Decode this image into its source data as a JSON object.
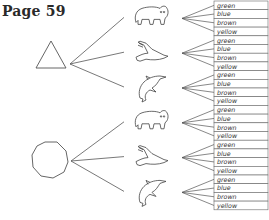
{
  "title": "Page 59",
  "diagram": {
    "type": "tree",
    "line_color": "#555555",
    "shapes": [
      {
        "name": "triangle",
        "cx": 44,
        "cy": 59
      },
      {
        "name": "octagon",
        "cx": 50,
        "cy": 161
      }
    ],
    "animals": [
      "bear",
      "eagle",
      "dolphin"
    ],
    "colors": [
      "green",
      "blue",
      "brown",
      "yellow"
    ],
    "label_box": {
      "x": 214,
      "width": 54,
      "row_height": 8.7,
      "top": 1
    }
  }
}
